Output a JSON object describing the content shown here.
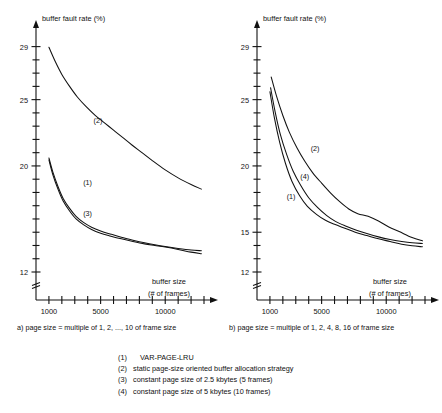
{
  "chart_data": [
    {
      "type": "line",
      "panel": "a",
      "title": "",
      "caption": "a) page size = multiple of 1, 2, ..., 10 of frame size",
      "ylabel": "buffer fault rate (%)",
      "xlabel": "buffer size",
      "xlabel_sub": "(# of frames)",
      "xlim": [
        0,
        13000
      ],
      "ylim": [
        12,
        29.8
      ],
      "ytick_labels": [
        "29",
        "25",
        "20",
        "12"
      ],
      "ytick_values": [
        29,
        25,
        20,
        12
      ],
      "ytick_minor_step": 1,
      "xtick_labels": [
        "1000",
        "5000",
        "10000"
      ],
      "xtick_values": [
        1000,
        5000,
        10000
      ],
      "xtick_minor_step": 1000,
      "axis_broken_below": 12,
      "grid": false,
      "legend_position": "inline-annotations",
      "series": [
        {
          "name": "(2)",
          "label": "(2)",
          "label_x": 4450,
          "label_y": 23.25,
          "x": [
            1000,
            1500,
            2000,
            2600,
            3200,
            3900,
            4600,
            5300,
            6000,
            6700,
            7400,
            8200,
            9000,
            10000,
            11000,
            12000,
            12800
          ],
          "y": [
            28.95,
            27.85,
            26.9,
            26.0,
            25.2,
            24.45,
            23.8,
            23.25,
            22.7,
            22.15,
            21.6,
            21.0,
            20.4,
            19.7,
            19.1,
            18.6,
            18.25
          ]
        },
        {
          "name": "(1)",
          "label": "(1)",
          "label_x": 3650,
          "label_y": 18.55,
          "x": [
            1000,
            1300,
            1700,
            2100,
            2600,
            3100,
            3700,
            4300,
            5000,
            5800,
            6600,
            7500,
            8400,
            9200,
            10000,
            11000,
            12000,
            12800
          ],
          "y": [
            20.6,
            19.55,
            18.45,
            17.55,
            16.8,
            16.2,
            15.72,
            15.38,
            15.1,
            14.85,
            14.62,
            14.4,
            14.2,
            14.05,
            13.92,
            13.78,
            13.66,
            13.6
          ]
        },
        {
          "name": "(3)",
          "label": "(3)",
          "label_x": 3650,
          "label_y": 16.25,
          "x": [
            1000,
            1300,
            1700,
            2100,
            2600,
            3100,
            3700,
            4300,
            5000,
            5800,
            6600,
            7500,
            8400,
            9200,
            10000,
            11000,
            12000,
            12800
          ],
          "y": [
            20.45,
            19.35,
            18.25,
            17.35,
            16.6,
            16.0,
            15.55,
            15.2,
            14.92,
            14.7,
            14.5,
            14.3,
            14.12,
            14.0,
            13.88,
            13.7,
            13.5,
            13.38
          ]
        }
      ]
    },
    {
      "type": "line",
      "panel": "b",
      "title": "",
      "caption": "b) page size = multiple of 1, 2, 4, 8, 16 of frame size",
      "ylabel": "buffer fault rate (%)",
      "xlabel": "buffer size",
      "xlabel_sub": "(# of frames)",
      "xlim": [
        0,
        13000
      ],
      "ylim": [
        12,
        29.8
      ],
      "ytick_labels": [
        "29",
        "25",
        "20",
        "15",
        "12"
      ],
      "ytick_values": [
        29,
        25,
        20,
        15,
        12
      ],
      "ytick_minor_step": 1,
      "xtick_labels": [
        "1000",
        "5000",
        "10000"
      ],
      "xtick_values": [
        1000,
        5000,
        10000
      ],
      "xtick_minor_step": 1000,
      "axis_broken_below": 12,
      "grid": false,
      "legend_position": "inline-annotations",
      "series": [
        {
          "name": "(2)",
          "label": "(2)",
          "label_x": 4150,
          "label_y": 21.1,
          "x": [
            1100,
            1500,
            2000,
            2500,
            3100,
            3700,
            4300,
            5000,
            5700,
            6400,
            7100,
            7800,
            8600,
            9400,
            10200,
            11000,
            12000,
            12800
          ],
          "y": [
            26.7,
            25.3,
            23.8,
            22.55,
            21.35,
            20.35,
            19.5,
            18.7,
            17.95,
            17.3,
            16.75,
            16.4,
            16.2,
            15.85,
            15.4,
            15.05,
            14.6,
            14.35
          ]
        },
        {
          "name": "(4)",
          "label": "(4)",
          "label_x": 3350,
          "label_y": 19.0,
          "x": [
            1050,
            1400,
            1800,
            2300,
            2800,
            3400,
            4000,
            4700,
            5400,
            6100,
            6900,
            7700,
            8500,
            9400,
            10300,
            11200,
            12000,
            12800
          ],
          "y": [
            25.9,
            24.1,
            22.4,
            20.85,
            19.6,
            18.5,
            17.6,
            16.85,
            16.25,
            15.8,
            15.45,
            15.15,
            14.9,
            14.65,
            14.45,
            14.3,
            14.2,
            14.15
          ]
        },
        {
          "name": "(1)",
          "label": "(1)",
          "label_x": 2300,
          "label_y": 17.5,
          "x": [
            1000,
            1350,
            1750,
            2200,
            2700,
            3300,
            3900,
            4600,
            5300,
            6000,
            6800,
            7600,
            8500,
            9400,
            10300,
            11200,
            12000,
            12800
          ],
          "y": [
            25.6,
            23.6,
            21.8,
            20.2,
            18.85,
            17.75,
            16.95,
            16.35,
            15.9,
            15.6,
            15.3,
            15.0,
            14.75,
            14.5,
            14.3,
            14.1,
            13.98,
            13.9
          ]
        }
      ]
    }
  ],
  "legend": {
    "items": [
      {
        "key": "(1)",
        "text": "VAR-PAGE-LRU"
      },
      {
        "key": "(2)",
        "text": "static page-size oriented buffer allocation strategy"
      },
      {
        "key": "(3)",
        "text": "constant page size of 2.5 kbytes (5 frames)"
      },
      {
        "key": "(4)",
        "text": "constant page size of 5 kbytes (10 frames)"
      }
    ]
  }
}
